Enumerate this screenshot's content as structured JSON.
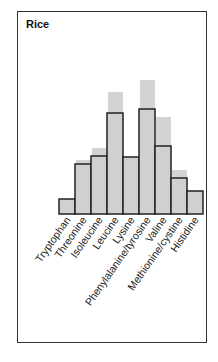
{
  "chart_data": {
    "type": "bar",
    "title": "Rice",
    "xlabel": "",
    "ylabel": "",
    "categories": [
      "Tryptophan",
      "Threonine",
      "Isoleucine",
      "Leucine",
      "Lysine",
      "Phenylalanine/tyrosine",
      "Valine",
      "Methionine/cystine",
      "Histidine"
    ],
    "series": [
      {
        "name": "Reference (gray shaded)",
        "values": [
          15,
          54,
          66,
          122,
          57,
          134,
          97,
          44,
          23
        ]
      },
      {
        "name": "Rice (outlined)",
        "values": [
          15,
          50,
          58,
          101,
          57,
          105,
          68,
          36,
          23
        ]
      }
    ],
    "ylim": [
      0,
      140
    ],
    "grid": false,
    "legend": "none",
    "colors": {
      "reference": "#d3d3d3",
      "outline": "#222222",
      "fill": "#d0d0d0"
    }
  }
}
